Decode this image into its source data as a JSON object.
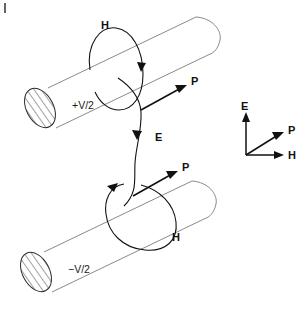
{
  "figure": {
    "width": 307,
    "height": 310,
    "background": "#ffffff"
  },
  "conductors": [
    {
      "id": "upper-conductor",
      "potential_label": "+V/2",
      "position": "upper",
      "end_cap": "hatched-ellipse"
    },
    {
      "id": "lower-conductor",
      "potential_label": "−V/2",
      "position": "lower",
      "end_cap": "hatched-ellipse"
    }
  ],
  "field_labels": {
    "h_upper": "H",
    "h_lower": "H",
    "e_center": "E",
    "p_upper": "P",
    "p_lower": "P"
  },
  "legend": {
    "name": "vector-triad",
    "e_label": "E",
    "p_label": "P",
    "h_label": "H"
  },
  "colors": {
    "stroke_dark": "#111111",
    "stroke_cylinder": "#8a8a8a",
    "cap_outline": "#2b2b2b",
    "background": "#ffffff"
  }
}
